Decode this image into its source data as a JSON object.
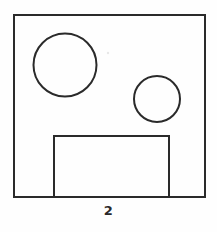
{
  "figure": {
    "caption": "2",
    "view_label": "2",
    "background_color": "#fefefe",
    "line_color": "#2a2a2a",
    "line_width": 2,
    "artifact_color": "#e8e8e8",
    "canvas": {
      "width": 217,
      "height": 232
    }
  },
  "chart_data": {
    "type": "diagram",
    "title": "2",
    "subtitle": "",
    "xlabel": "",
    "ylabel": "",
    "units": "px",
    "xlim": [
      0,
      217
    ],
    "ylim": [
      0,
      232
    ],
    "grid": false,
    "legend": false,
    "shapes": [
      {
        "name": "outer-square",
        "kind": "rect",
        "x": 14,
        "y": 15,
        "width": 191,
        "height": 182,
        "stroke": "#2a2a2a",
        "stroke_width": 2,
        "fill": "none"
      },
      {
        "name": "large-circle",
        "kind": "circle",
        "cx": 65,
        "cy": 65,
        "r": 31.5,
        "diameter": 63,
        "stroke": "#2a2a2a",
        "stroke_width": 2,
        "fill": "none"
      },
      {
        "name": "small-circle",
        "kind": "circle",
        "cx": 157,
        "cy": 99,
        "r": 23,
        "diameter": 46,
        "stroke": "#2a2a2a",
        "stroke_width": 2,
        "fill": "none"
      },
      {
        "name": "bottom-notch",
        "kind": "open-rect",
        "x": 54,
        "y": 136,
        "width": 115,
        "height": 61,
        "open_side": "bottom",
        "stroke": "#2a2a2a",
        "stroke_width": 2,
        "fill": "none"
      },
      {
        "name": "speck-artifact",
        "kind": "dot",
        "cx": 108,
        "cy": 53,
        "r": 1.2,
        "stroke": "none",
        "fill": "#e8e8e8"
      }
    ],
    "labels": [
      {
        "name": "view-number",
        "text": "2",
        "x": 109,
        "y": 212,
        "anchor": "middle"
      }
    ]
  }
}
